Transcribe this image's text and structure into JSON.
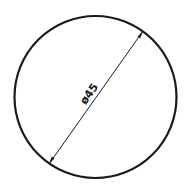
{
  "diagram": {
    "shape": "circle",
    "dimension": {
      "label": "ø45",
      "symbol": "ø",
      "value": 45,
      "type": "diameter"
    },
    "colors": {
      "stroke": "#1a1a1a",
      "background": "#ffffff"
    }
  }
}
